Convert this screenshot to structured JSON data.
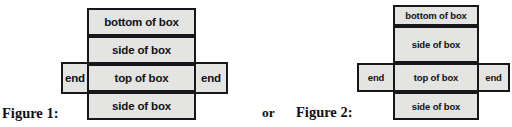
{
  "page": {
    "background_color": "#ffffff",
    "cell_fill_color": "#e4e4e2",
    "border_color": "#17161a",
    "text_color": "#111013"
  },
  "conjunction": {
    "label": "or"
  },
  "figure1": {
    "caption": "Figure 1:",
    "cells": {
      "bottom_of_box": "bottom of box",
      "side_of_box_top": "side of box",
      "top_of_box": "top of box",
      "side_of_box_bottom": "side of box",
      "end_left": "end",
      "end_right": "end"
    }
  },
  "figure2": {
    "caption": "Figure 2:",
    "cells": {
      "bottom_of_box": "bottom of box",
      "side_of_box_top": "side of box",
      "top_of_box": "top of box",
      "side_of_box_bottom": "side of box",
      "end_left": "end",
      "end_right": "end"
    }
  }
}
